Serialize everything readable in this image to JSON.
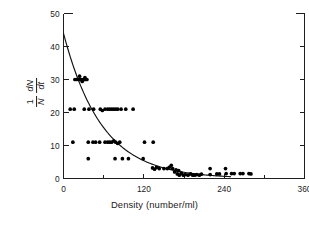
{
  "chart_data": {
    "type": "scatter",
    "title": "",
    "xlabel": "Density (number/ml)",
    "ylabel": "1/N dN/dt",
    "ylabel_parts": {
      "numerator_left": "1",
      "denominator_left": "N",
      "numerator_right": "dN",
      "denominator_right": "dt"
    },
    "xlim": [
      0,
      360
    ],
    "ylim": [
      0,
      50
    ],
    "xticks": [
      0,
      120,
      240,
      360
    ],
    "xtick_labels": [
      "0",
      "120",
      "240",
      "360"
    ],
    "xminorticks": [
      60,
      180,
      300
    ],
    "yticks": [
      0,
      10,
      20,
      30,
      40,
      50
    ],
    "ytick_labels": [
      "0",
      "10",
      "20",
      "30",
      "40",
      "50"
    ],
    "grid": false,
    "legend": false,
    "legend_position": "none",
    "frame": "open-top",
    "marker": "filled-circle",
    "marker_color": "#000000",
    "curve_color": "#111111",
    "fit": {
      "form": "exponential-decay",
      "intercept": 44,
      "decay_constant": 0.0175,
      "description": "y = 44 * exp(-0.0175 * x)"
    },
    "points": [
      [
        17,
        30
      ],
      [
        20,
        30
      ],
      [
        23,
        30
      ],
      [
        25,
        30
      ],
      [
        27,
        30
      ],
      [
        29,
        30
      ],
      [
        31,
        30
      ],
      [
        33,
        30
      ],
      [
        35,
        30
      ],
      [
        24,
        31
      ],
      [
        28,
        29.4
      ],
      [
        32,
        30.6
      ],
      [
        10,
        21
      ],
      [
        16,
        21
      ],
      [
        31,
        21
      ],
      [
        38,
        21
      ],
      [
        45,
        21
      ],
      [
        55,
        21
      ],
      [
        58,
        20.6
      ],
      [
        62,
        21
      ],
      [
        66,
        21
      ],
      [
        69,
        21
      ],
      [
        72,
        21
      ],
      [
        75,
        21
      ],
      [
        78,
        21
      ],
      [
        81,
        21
      ],
      [
        86,
        21
      ],
      [
        93,
        21
      ],
      [
        104,
        21
      ],
      [
        14,
        11
      ],
      [
        37,
        11
      ],
      [
        44,
        11
      ],
      [
        48,
        11
      ],
      [
        54,
        11
      ],
      [
        62,
        11
      ],
      [
        66,
        11
      ],
      [
        69,
        11
      ],
      [
        72,
        11
      ],
      [
        75,
        11.4
      ],
      [
        78,
        11
      ],
      [
        81,
        10.6
      ],
      [
        84,
        11
      ],
      [
        121,
        11
      ],
      [
        134,
        11
      ],
      [
        37,
        6
      ],
      [
        77,
        6
      ],
      [
        88,
        6
      ],
      [
        97,
        6
      ],
      [
        119,
        6
      ],
      [
        133,
        3.2
      ],
      [
        136,
        2.8
      ],
      [
        139,
        3.4
      ],
      [
        143,
        3
      ],
      [
        150,
        3
      ],
      [
        155,
        3
      ],
      [
        158,
        3.4
      ],
      [
        161,
        4
      ],
      [
        163,
        3
      ],
      [
        166,
        2
      ],
      [
        170,
        1.4
      ],
      [
        173,
        1
      ],
      [
        176,
        1.6
      ],
      [
        179,
        1
      ],
      [
        182,
        1.2
      ],
      [
        186,
        1
      ],
      [
        190,
        1.4
      ],
      [
        193,
        1
      ],
      [
        196,
        1
      ],
      [
        199,
        1.2
      ],
      [
        203,
        1
      ],
      [
        206,
        1.3
      ],
      [
        168,
        2.6
      ],
      [
        172,
        2.4
      ],
      [
        219,
        3
      ],
      [
        219,
        1.2
      ],
      [
        229,
        1.4
      ],
      [
        233,
        1.4
      ],
      [
        242,
        3
      ],
      [
        243,
        1.5
      ],
      [
        251,
        1.5
      ],
      [
        255,
        1.5
      ],
      [
        264,
        1.5
      ],
      [
        268,
        1.5
      ],
      [
        277,
        1.5
      ],
      [
        280,
        1.4
      ]
    ]
  },
  "axes": {
    "x_title": "Density (number/ml)",
    "y_num_1": "1",
    "y_den_1": "N",
    "y_num_2": "dN",
    "y_den_2": "dt"
  },
  "colors": {
    "axis": "#1f1f1f",
    "marker": "#000000",
    "curve": "#111111",
    "background": "#ffffff"
  }
}
